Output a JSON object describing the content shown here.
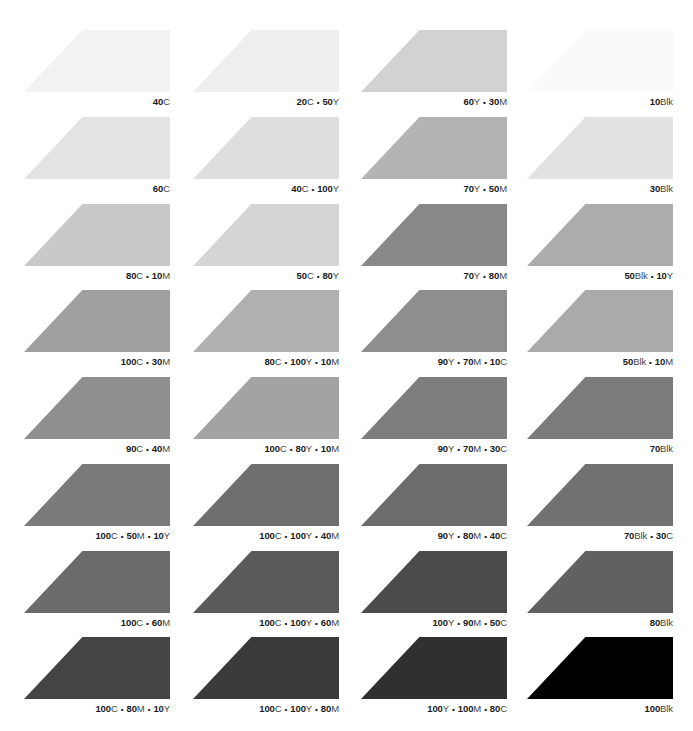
{
  "swatches": [
    {
      "label": "40C",
      "parts": [
        [
          "40",
          "C"
        ]
      ],
      "color": "#f2f2f2"
    },
    {
      "label": "20C • 50Y",
      "parts": [
        [
          "20",
          "C"
        ],
        [
          "50",
          "Y"
        ]
      ],
      "color": "#eeeeee"
    },
    {
      "label": "60Y • 30M",
      "parts": [
        [
          "60",
          "Y"
        ],
        [
          "30",
          "M"
        ]
      ],
      "color": "#d2d2d2"
    },
    {
      "label": "10Blk",
      "parts": [
        [
          "10",
          "Blk"
        ]
      ],
      "color": "#fafafa"
    },
    {
      "label": "60C",
      "parts": [
        [
          "60",
          "C"
        ]
      ],
      "color": "#e3e3e3"
    },
    {
      "label": "40C • 100Y",
      "parts": [
        [
          "40",
          "C"
        ],
        [
          "100",
          "Y"
        ]
      ],
      "color": "#dedede"
    },
    {
      "label": "70Y • 50M",
      "parts": [
        [
          "70",
          "Y"
        ],
        [
          "50",
          "M"
        ]
      ],
      "color": "#b4b4b4"
    },
    {
      "label": "30Blk",
      "parts": [
        [
          "30",
          "Blk"
        ]
      ],
      "color": "#e2e2e2"
    },
    {
      "label": "80C • 10M",
      "parts": [
        [
          "80",
          "C"
        ],
        [
          "10",
          "M"
        ]
      ],
      "color": "#c9c9c9"
    },
    {
      "label": "50C • 80Y",
      "parts": [
        [
          "50",
          "C"
        ],
        [
          "80",
          "Y"
        ]
      ],
      "color": "#d5d5d5"
    },
    {
      "label": "70Y • 80M",
      "parts": [
        [
          "70",
          "Y"
        ],
        [
          "80",
          "M"
        ]
      ],
      "color": "#888888"
    },
    {
      "label": "50Blk • 10Y",
      "parts": [
        [
          "50",
          "Blk"
        ],
        [
          "10",
          "Y"
        ]
      ],
      "color": "#acacac"
    },
    {
      "label": "100C • 30M",
      "parts": [
        [
          "100",
          "C"
        ],
        [
          "30",
          "M"
        ]
      ],
      "color": "#a0a0a0"
    },
    {
      "label": "80C • 100Y • 10M",
      "parts": [
        [
          "80",
          "C"
        ],
        [
          "100",
          "Y"
        ],
        [
          "10",
          "M"
        ]
      ],
      "color": "#b0b0b0"
    },
    {
      "label": "90Y • 70M • 10C",
      "parts": [
        [
          "90",
          "Y"
        ],
        [
          "70",
          "M"
        ],
        [
          "10",
          "C"
        ]
      ],
      "color": "#8e8e8e"
    },
    {
      "label": "50Blk • 10M",
      "parts": [
        [
          "50",
          "Blk"
        ],
        [
          "10",
          "M"
        ]
      ],
      "color": "#aaaaaa"
    },
    {
      "label": "90C • 40M",
      "parts": [
        [
          "90",
          "C"
        ],
        [
          "40",
          "M"
        ]
      ],
      "color": "#8f8f8f"
    },
    {
      "label": "100C • 80Y • 10M",
      "parts": [
        [
          "100",
          "C"
        ],
        [
          "80",
          "Y"
        ],
        [
          "10",
          "M"
        ]
      ],
      "color": "#a3a3a3"
    },
    {
      "label": "90Y • 70M • 30C",
      "parts": [
        [
          "90",
          "Y"
        ],
        [
          "70",
          "M"
        ],
        [
          "30",
          "C"
        ]
      ],
      "color": "#7d7d7d"
    },
    {
      "label": "70Blk",
      "parts": [
        [
          "70",
          "Blk"
        ]
      ],
      "color": "#7b7b7b"
    },
    {
      "label": "100C • 50M • 10Y",
      "parts": [
        [
          "100",
          "C"
        ],
        [
          "50",
          "M"
        ],
        [
          "10",
          "Y"
        ]
      ],
      "color": "#7a7a7a"
    },
    {
      "label": "100C • 100Y • 40M",
      "parts": [
        [
          "100",
          "C"
        ],
        [
          "100",
          "Y"
        ],
        [
          "40",
          "M"
        ]
      ],
      "color": "#6f6f6f"
    },
    {
      "label": "90Y • 80M • 40C",
      "parts": [
        [
          "90",
          "Y"
        ],
        [
          "80",
          "M"
        ],
        [
          "40",
          "C"
        ]
      ],
      "color": "#6c6c6c"
    },
    {
      "label": "70Blk • 30C",
      "parts": [
        [
          "70",
          "Blk"
        ],
        [
          "30",
          "C"
        ]
      ],
      "color": "#717171"
    },
    {
      "label": "100C • 60M",
      "parts": [
        [
          "100",
          "C"
        ],
        [
          "60",
          "M"
        ]
      ],
      "color": "#6b6b6b"
    },
    {
      "label": "100C • 100Y • 60M",
      "parts": [
        [
          "100",
          "C"
        ],
        [
          "100",
          "Y"
        ],
        [
          "60",
          "M"
        ]
      ],
      "color": "#5a5a5a"
    },
    {
      "label": "100Y • 90M • 50C",
      "parts": [
        [
          "100",
          "Y"
        ],
        [
          "90",
          "M"
        ],
        [
          "50",
          "C"
        ]
      ],
      "color": "#4b4b4b"
    },
    {
      "label": "80Blk",
      "parts": [
        [
          "80",
          "Blk"
        ]
      ],
      "color": "#616161"
    },
    {
      "label": "100C • 80M • 10Y",
      "parts": [
        [
          "100",
          "C"
        ],
        [
          "80",
          "M"
        ],
        [
          "10",
          "Y"
        ]
      ],
      "color": "#444444"
    },
    {
      "label": "100C • 100Y • 80M",
      "parts": [
        [
          "100",
          "C"
        ],
        [
          "100",
          "Y"
        ],
        [
          "80",
          "M"
        ]
      ],
      "color": "#3a3a3a"
    },
    {
      "label": "100Y • 100M • 80C",
      "parts": [
        [
          "100",
          "Y"
        ],
        [
          "100",
          "M"
        ],
        [
          "80",
          "C"
        ]
      ],
      "color": "#303030"
    },
    {
      "label": "100Blk",
      "parts": [
        [
          "100",
          "Blk"
        ]
      ],
      "color": "#000000"
    }
  ],
  "layout": {
    "columns": 4,
    "col_x": [
      24,
      193,
      361,
      527
    ],
    "row_y": [
      30,
      117,
      204,
      290,
      377,
      464,
      551,
      637
    ]
  }
}
